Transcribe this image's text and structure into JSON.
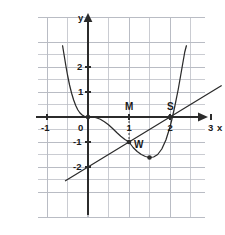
{
  "figure": {
    "type": "cartesian-graph",
    "background": "#ffffff",
    "grid_color": "#b9bcc4",
    "axis_color": "#2b2b2b",
    "curve_color": "#2b2b2b",
    "line_color": "#2b2b2b"
  },
  "axes": {
    "x_axis_label": "x",
    "y_axis_label": "y",
    "x_ticks": [
      {
        "value": -1,
        "label": "-1"
      },
      {
        "value": 1,
        "label": "1"
      },
      {
        "value": 2,
        "label": "2"
      },
      {
        "value": 3,
        "label": "3"
      }
    ],
    "y_ticks": [
      {
        "value": 2,
        "label": "2"
      },
      {
        "value": 1,
        "label": "1"
      },
      {
        "value": -1,
        "label": "-1"
      },
      {
        "value": -2,
        "label": "-2"
      }
    ],
    "origin_label": "0",
    "xlim": [
      -1.95,
      3.6
    ],
    "ylim": [
      -2.55,
      2.85
    ]
  },
  "annotations": {
    "point_m": "M",
    "point_s": "S",
    "point_w": "W"
  },
  "chart_data": {
    "type": "line",
    "title": "",
    "xlabel": "x",
    "ylabel": "y",
    "xlim": [
      -1.95,
      3.6
    ],
    "ylim": [
      -2.55,
      2.85
    ],
    "grid": true,
    "grid_spacing": 1,
    "legend": "none",
    "series": [
      {
        "name": "curve",
        "type": "curve",
        "color": "#2b2b2b",
        "points": [
          [
            -0.62,
            2.85
          ],
          [
            -0.58,
            2.45
          ],
          [
            -0.54,
            2.05
          ],
          [
            -0.5,
            1.68
          ],
          [
            -0.45,
            1.28
          ],
          [
            -0.4,
            0.95
          ],
          [
            -0.35,
            0.68
          ],
          [
            -0.3,
            0.46
          ],
          [
            -0.25,
            0.29
          ],
          [
            -0.2,
            0.17
          ],
          [
            -0.15,
            0.09
          ],
          [
            -0.1,
            0.035
          ],
          [
            -0.05,
            0.008
          ],
          [
            0.0,
            0.0
          ],
          [
            0.1,
            0.0
          ],
          [
            0.2,
            -0.03
          ],
          [
            0.3,
            -0.09
          ],
          [
            0.4,
            -0.19
          ],
          [
            0.5,
            -0.31
          ],
          [
            0.6,
            -0.46
          ],
          [
            0.7,
            -0.62
          ],
          [
            0.8,
            -0.77
          ],
          [
            0.9,
            -0.9
          ],
          [
            1.0,
            -1.0
          ],
          [
            1.1,
            -1.22
          ],
          [
            1.2,
            -1.38
          ],
          [
            1.3,
            -1.5
          ],
          [
            1.4,
            -1.58
          ],
          [
            1.5,
            -1.62
          ],
          [
            1.6,
            -1.6
          ],
          [
            1.7,
            -1.5
          ],
          [
            1.8,
            -1.28
          ],
          [
            1.9,
            -0.92
          ],
          [
            2.0,
            -0.4
          ],
          [
            2.06,
            0.0
          ],
          [
            2.12,
            0.45
          ],
          [
            2.2,
            1.1
          ],
          [
            2.28,
            1.85
          ],
          [
            2.36,
            2.6
          ],
          [
            2.4,
            2.85
          ]
        ]
      },
      {
        "name": "tangent-line",
        "type": "straight-line",
        "color": "#2b2b2b",
        "slope": 1,
        "intercept": -2,
        "points": [
          [
            -0.55,
            -2.55
          ],
          [
            3.25,
            1.25
          ]
        ]
      }
    ],
    "marked_points": [
      {
        "label": "",
        "x": 0,
        "y": 0,
        "marker": "dot"
      },
      {
        "label": "W",
        "x": 1,
        "y": -1,
        "marker": "dot"
      },
      {
        "label": "S",
        "x": 2,
        "y": 0,
        "marker": "dot"
      },
      {
        "label": "",
        "x": 1.5,
        "y": -1.62,
        "marker": "dot"
      }
    ],
    "guide_segments": [
      {
        "name": "m-drop",
        "from": [
          1,
          0
        ],
        "to": [
          1,
          -1
        ],
        "style": "dashed"
      }
    ]
  }
}
